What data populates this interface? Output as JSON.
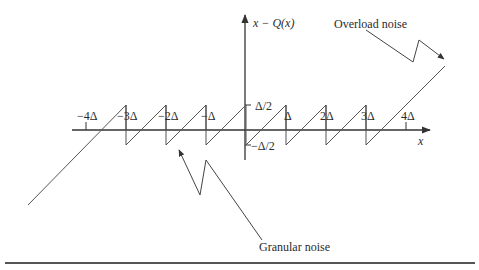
{
  "figure": {
    "y_axis_label": "x − Q(x)",
    "x_axis_label": "x",
    "x_ticks": [
      {
        "label": "−4Δ",
        "x": 86
      },
      {
        "label": "−3Δ",
        "x": 126
      },
      {
        "label": "−2Δ",
        "x": 166
      },
      {
        "label": "−Δ",
        "x": 206
      },
      {
        "label": "Δ",
        "x": 286
      },
      {
        "label": "2Δ",
        "x": 326
      },
      {
        "label": "3Δ",
        "x": 366
      },
      {
        "label": "4Δ",
        "x": 406
      }
    ],
    "y_ticks": [
      {
        "label": "Δ/2"
      },
      {
        "label": "−Δ/2"
      }
    ],
    "annotations": {
      "overload": "Overload noise",
      "granular": "Granular noise"
    },
    "colors": {
      "line": "#555555",
      "axis": "#333333",
      "text": "#2b2b2b",
      "rule": "#555555"
    }
  }
}
